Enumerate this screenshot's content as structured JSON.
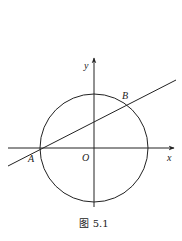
{
  "figure": {
    "caption": "图 5.1",
    "labels": {
      "x_axis": "x",
      "y_axis": "y",
      "origin": "O",
      "point_a": "A",
      "point_b": "B"
    }
  },
  "colors": {
    "stroke": "#222222",
    "background": "#ffffff"
  }
}
